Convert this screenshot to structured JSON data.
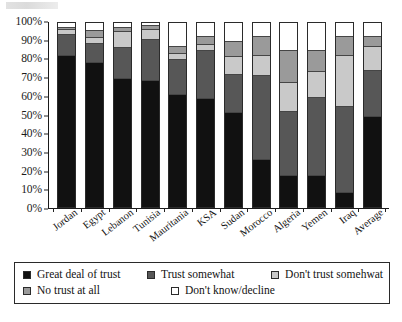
{
  "chart_data": {
    "type": "bar",
    "subtype": "stacked-percent",
    "title": "",
    "xlabel": "",
    "ylabel": "",
    "ylim": [
      0,
      100
    ],
    "ytick_labels": [
      "100%",
      "90%",
      "80%",
      "70%",
      "60%",
      "50%",
      "40%",
      "30%",
      "20%",
      "10%",
      "0%"
    ],
    "ytick_values": [
      100,
      90,
      80,
      70,
      60,
      50,
      40,
      30,
      20,
      10,
      0
    ],
    "grid": false,
    "legend_position": "bottom",
    "categories": [
      "Jordan",
      "Egypt",
      "Lebanon",
      "Tunisia",
      "Mauritania",
      "KSA",
      "Sudan",
      "Morocco",
      "Algeria",
      "Yemen",
      "Iraq",
      "Average"
    ],
    "series": [
      {
        "name": "Great deal of trust",
        "color": "#111111",
        "values": [
          84,
          80,
          71,
          70,
          62,
          60,
          52,
          26,
          17,
          17,
          8,
          50
        ]
      },
      {
        "name": "Trust somewhat",
        "color": "#575757",
        "values": [
          11,
          10,
          17,
          22,
          19,
          26,
          21,
          46,
          35,
          43,
          47,
          25
        ]
      },
      {
        "name": "Don't trust somehwat",
        "color": "#c9c9c9",
        "values": [
          2,
          3,
          8,
          5,
          3,
          3,
          9,
          11,
          16,
          14,
          28,
          13
        ]
      },
      {
        "name": "No trust at all",
        "color": "#9a9a9a",
        "values": [
          1,
          3,
          2,
          2,
          3,
          4,
          8,
          10,
          17,
          11,
          10,
          5
        ]
      },
      {
        "name": "Don't know/decline",
        "color": "#ffffff",
        "values": [
          2,
          4,
          2,
          1,
          13,
          7,
          10,
          7,
          15,
          15,
          7,
          7
        ]
      }
    ]
  },
  "legend": {
    "items": [
      {
        "label": "Great deal of trust",
        "color": "#111111"
      },
      {
        "label": "Trust somewhat",
        "color": "#575757"
      },
      {
        "label": "Don't trust somehwat",
        "color": "#c9c9c9"
      },
      {
        "label": "No trust at all",
        "color": "#9a9a9a"
      },
      {
        "label": "Don't know/decline",
        "color": "#ffffff"
      }
    ]
  }
}
